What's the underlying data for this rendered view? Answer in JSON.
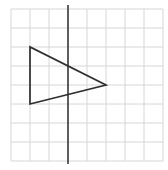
{
  "diagram": {
    "type": "geometry-grid",
    "canvas": {
      "width": 168,
      "height": 170
    },
    "background_color": "#ffffff",
    "grid": {
      "origin_x": 11,
      "origin_y": 9,
      "cell_size": 19,
      "cols": 8,
      "rows": 8,
      "line_color": "#d6d6d6",
      "line_width": 1
    },
    "mirror_line": {
      "grid_col": 3,
      "overhang_top": 4,
      "overhang_bottom": 3,
      "color": "#3a3a3a",
      "width": 1.6
    },
    "triangle": {
      "vertices_grid": [
        [
          1,
          2
        ],
        [
          1,
          5
        ],
        [
          5,
          4
        ]
      ],
      "stroke_color": "#2e2e2e",
      "stroke_width": 1.7,
      "fill": "none"
    }
  }
}
